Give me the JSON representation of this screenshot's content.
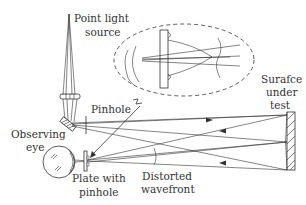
{
  "diagram": {
    "type": "optical-setup",
    "labels": {
      "light_source_line1": "Point light",
      "light_source_line2": "source",
      "pinhole": "Pinhole",
      "eye_line1": "Observing",
      "eye_line2": "eye",
      "plate_line1": "Plate with",
      "plate_line2": "pinhole",
      "wavefront_line1": "Distorted",
      "wavefront_line2": "wavefront",
      "surface_line1": "Surafce",
      "surface_line2": "under",
      "surface_line3": "test"
    },
    "components": [
      "point-light-source",
      "lens",
      "beam-splitter",
      "pinhole",
      "observing-eye",
      "plate-with-pinhole",
      "surface-under-test",
      "magnified-inset"
    ],
    "colors": {
      "stroke": "#333333",
      "background": "#ffffff"
    }
  }
}
